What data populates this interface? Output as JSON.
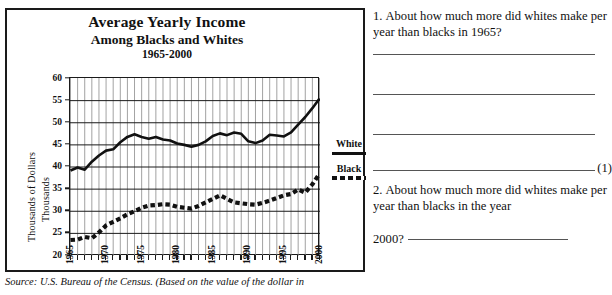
{
  "chart_panel": {
    "title_line1": "Average Yearly Income",
    "title_line2": "Among Blacks and Whites",
    "title_line3": "1965-2000",
    "y_axis_label_1": "Thousands of Dollars",
    "y_axis_label_2": "Thousands",
    "legend": {
      "white_label": "White",
      "black_label": "Black"
    },
    "source": "Source: U.S. Bureau of the Census. (Based on the value of the dollar in"
  },
  "chart_data": {
    "type": "line",
    "title": "Average Yearly Income Among Blacks and Whites 1965-2000",
    "xlabel": "",
    "ylabel": "Thousands of Dollars",
    "ylim": [
      20,
      60
    ],
    "xlim": [
      1965,
      2000
    ],
    "yticks": [
      20,
      25,
      30,
      35,
      40,
      45,
      50,
      55,
      60
    ],
    "xticks": [
      1965,
      1970,
      1975,
      1980,
      1985,
      1990,
      1995,
      2000
    ],
    "grid": true,
    "legend_position": "right",
    "x": [
      1965,
      1966,
      1967,
      1968,
      1969,
      1970,
      1971,
      1972,
      1973,
      1974,
      1975,
      1976,
      1977,
      1978,
      1979,
      1980,
      1981,
      1982,
      1983,
      1984,
      1985,
      1986,
      1987,
      1988,
      1989,
      1990,
      1991,
      1992,
      1993,
      1994,
      1995,
      1996,
      1997,
      1998,
      1999,
      2000
    ],
    "series": [
      {
        "name": "White",
        "style": "solid",
        "color": "#111111",
        "values": [
          39.2,
          39.9,
          39.4,
          41.2,
          42.6,
          43.7,
          44.0,
          45.6,
          46.8,
          47.4,
          46.8,
          46.4,
          46.8,
          46.2,
          46.0,
          45.3,
          45.0,
          44.6,
          45.0,
          45.8,
          47.0,
          47.6,
          47.2,
          47.8,
          47.5,
          45.8,
          45.4,
          46.0,
          47.3,
          47.1,
          46.9,
          47.8,
          49.6,
          51.3,
          53.3,
          55.5
        ]
      },
      {
        "name": "Black",
        "style": "dashed",
        "color": "#111111",
        "values": [
          23.5,
          23.6,
          24.2,
          23.9,
          25.2,
          26.8,
          27.6,
          28.4,
          29.3,
          30.0,
          30.8,
          31.3,
          31.4,
          31.6,
          31.5,
          31.0,
          30.8,
          30.6,
          31.2,
          32.0,
          32.8,
          33.6,
          32.8,
          32.0,
          31.8,
          31.6,
          31.5,
          31.9,
          32.4,
          33.0,
          33.6,
          33.9,
          34.9,
          34.2,
          36.1,
          38.5
        ]
      }
    ]
  },
  "questions": {
    "q1": {
      "number": "1.",
      "text": "About how much more did whites make per year than blacks in 1965?",
      "answer_value": "",
      "marker": "(1)"
    },
    "q2": {
      "number": "2.",
      "text": "About how much more did whites make per year than blacks in the year",
      "continuation": "2000?",
      "answer_value": ""
    }
  }
}
